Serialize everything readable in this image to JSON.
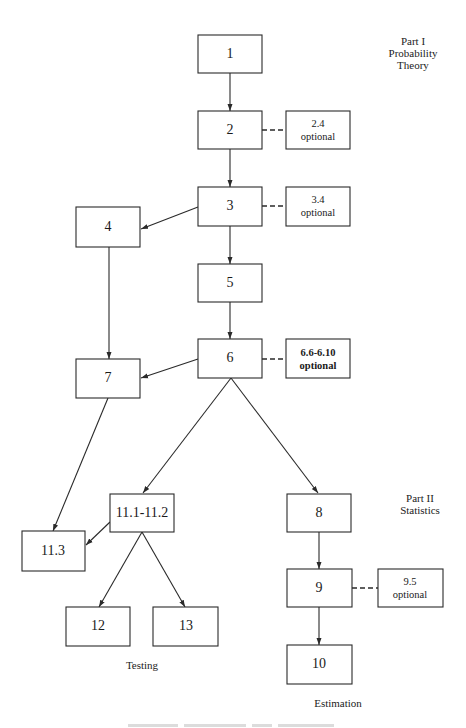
{
  "diagram": {
    "part1_label": [
      "Part I",
      "Probability",
      "Theory"
    ],
    "part2_label": [
      "Part II",
      "Statistics"
    ],
    "testing_label": "Testing",
    "estimation_label": "Estimation",
    "nodes": {
      "n1": "1",
      "n2": "2",
      "n3": "3",
      "n4": "4",
      "n5": "5",
      "n6": "6",
      "n7": "7",
      "n8": "8",
      "n9": "9",
      "n10": "10",
      "n11_1_2": "11.1-11.2",
      "n11_3": "11.3",
      "n12": "12",
      "n13": "13"
    },
    "optional_nodes": {
      "o2": [
        "2.4",
        "optional"
      ],
      "o3": [
        "3.4",
        "optional"
      ],
      "o6": [
        "6.6-6.10",
        "optional"
      ],
      "o9": [
        "9.5",
        "optional"
      ]
    },
    "edges": [
      [
        "1",
        "2"
      ],
      [
        "2",
        "3"
      ],
      [
        "3",
        "4"
      ],
      [
        "3",
        "5"
      ],
      [
        "4",
        "7"
      ],
      [
        "5",
        "6"
      ],
      [
        "6",
        "7"
      ],
      [
        "6",
        "11.1-11.2"
      ],
      [
        "6",
        "8"
      ],
      [
        "7",
        "11.3"
      ],
      [
        "11.1-11.2",
        "11.3"
      ],
      [
        "11.1-11.2",
        "12"
      ],
      [
        "11.1-11.2",
        "13"
      ],
      [
        "8",
        "9"
      ],
      [
        "9",
        "10"
      ]
    ],
    "dashed_links": [
      [
        "2",
        "2.4 optional"
      ],
      [
        "3",
        "3.4 optional"
      ],
      [
        "6",
        "6.6-6.10 optional"
      ],
      [
        "9",
        "9.5 optional"
      ]
    ]
  }
}
